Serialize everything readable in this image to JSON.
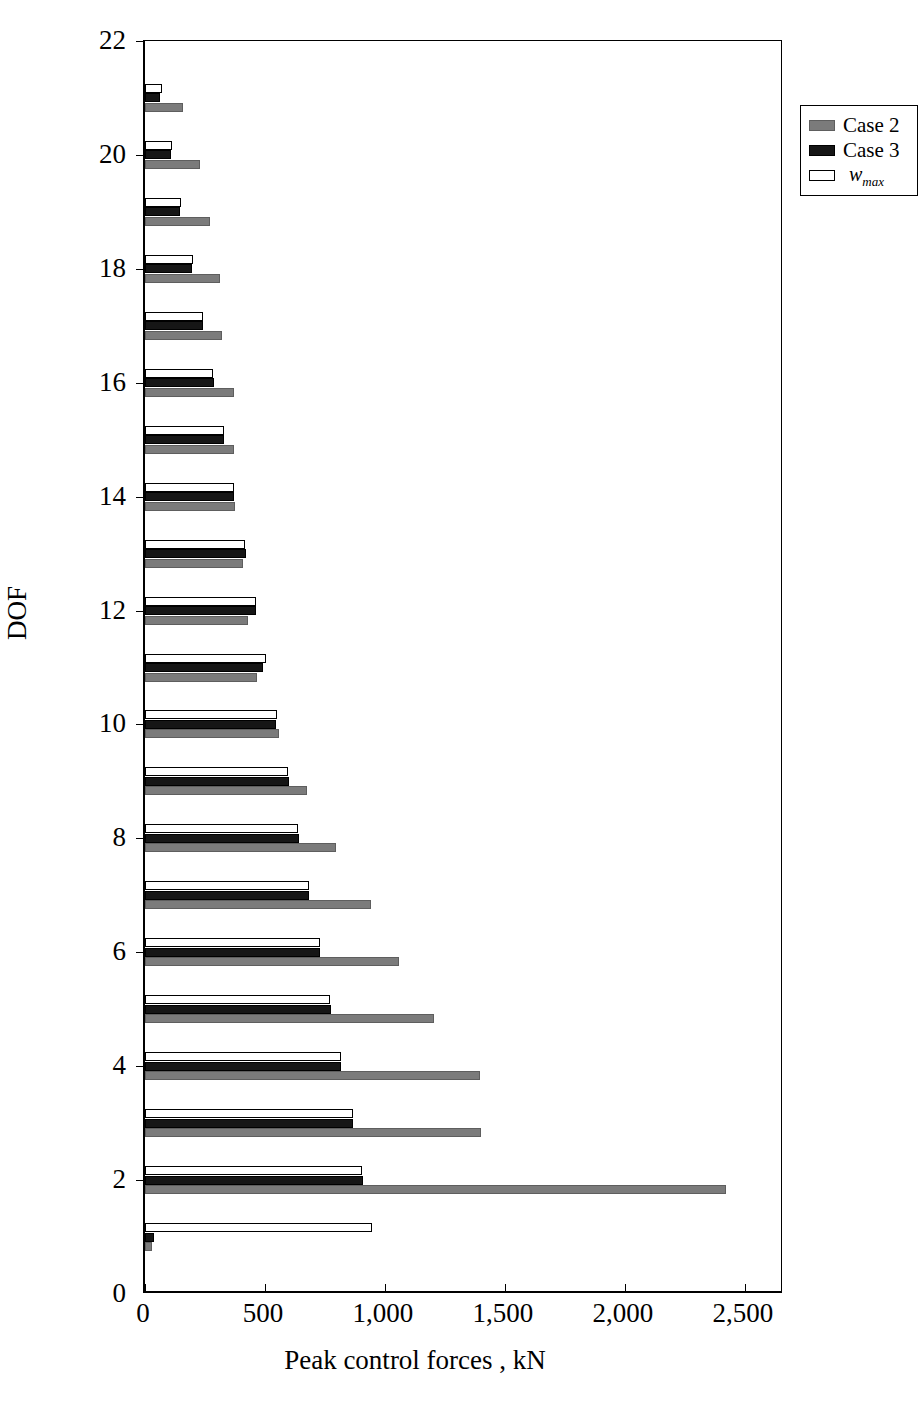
{
  "chart_data": {
    "type": "bar",
    "orientation": "horizontal",
    "title": "",
    "xlabel": "Peak control forces , kN",
    "ylabel": "DOF",
    "xlim": [
      0,
      2663
    ],
    "ylim": [
      0,
      22
    ],
    "xticks": [
      0,
      500,
      1000,
      1500,
      2000,
      2500
    ],
    "xticklabels": [
      "0",
      "500",
      "1,000",
      "1,500",
      "2,000",
      "2,500"
    ],
    "yticks": [
      0,
      2,
      4,
      6,
      8,
      10,
      12,
      14,
      16,
      18,
      20,
      22
    ],
    "yticklabels": [
      "0",
      "2",
      "4",
      "6",
      "8",
      "10",
      "12",
      "14",
      "16",
      "18",
      "20",
      "22"
    ],
    "grid": false,
    "legend_position": "upper right",
    "categories": [
      1,
      2,
      3,
      4,
      5,
      6,
      7,
      8,
      9,
      10,
      11,
      12,
      13,
      14,
      15,
      16,
      17,
      18,
      19,
      20,
      21
    ],
    "series": [
      {
        "name": "Case 2",
        "color": "#7b7b7b",
        "values": [
          30,
          2420,
          1400,
          1395,
          1205,
          1060,
          940,
          795,
          675,
          560,
          465,
          430,
          410,
          375,
          370,
          370,
          320,
          312,
          270,
          228,
          157
        ]
      },
      {
        "name": "Case 3",
        "color": "#161616",
        "values": [
          38,
          910,
          865,
          815,
          775,
          730,
          685,
          640,
          600,
          548,
          492,
          462,
          420,
          372,
          330,
          287,
          240,
          196,
          145,
          108,
          62
        ]
      },
      {
        "name": "w_max",
        "color": "#ffffff",
        "values": [
          945,
          905,
          868,
          818,
          772,
          728,
          684,
          636,
          597,
          552,
          505,
          462,
          415,
          370,
          330,
          285,
          242,
          200,
          148,
          113,
          71
        ]
      }
    ]
  },
  "legend": {
    "items": [
      {
        "label": "Case 2",
        "style": "case2"
      },
      {
        "label": "Case 3",
        "style": "case3"
      },
      {
        "label": "w",
        "sub": "max",
        "style": "wmax"
      }
    ]
  },
  "axes": {
    "x_title": "Peak control forces , kN",
    "y_title": "DOF"
  }
}
